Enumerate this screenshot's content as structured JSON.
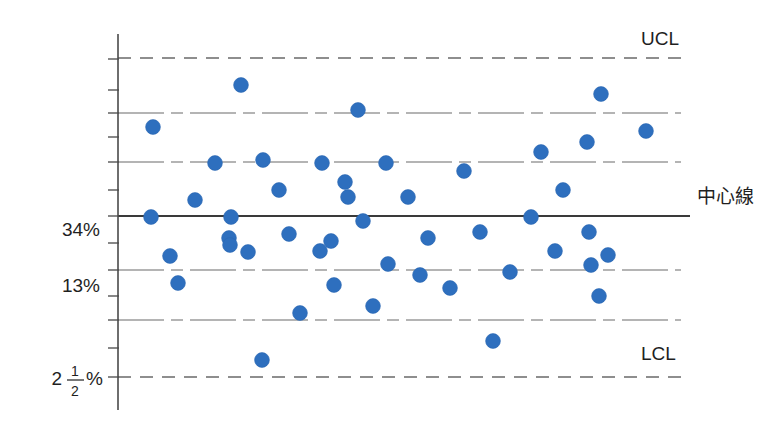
{
  "chart_data": {
    "type": "scatter",
    "title": "",
    "xlabel": "",
    "ylabel": "",
    "grid": true,
    "legend_position": "right",
    "axis": {
      "y_tick_labels": [
        "34%",
        "13%"
      ],
      "y_fraction_label": {
        "whole": "2",
        "numerator": "1",
        "denominator": "2",
        "unit": "%"
      },
      "x_range_visible": false
    },
    "reference_lines": [
      {
        "name": "UCL",
        "label": "UCL",
        "style": "dashed",
        "y_value": 99.85
      },
      {
        "name": "zone_a_upper",
        "label": "",
        "style": "dash-dot",
        "y_value": 97.5
      },
      {
        "name": "zone_b_upper",
        "label": "",
        "style": "dash-dot",
        "y_value": 84
      },
      {
        "name": "center",
        "label": "中心線",
        "style": "solid",
        "y_value": 50
      },
      {
        "name": "zone_b_lower",
        "label": "",
        "style": "dash-dot",
        "y_value": 16
      },
      {
        "name": "zone_a_lower",
        "label": "",
        "style": "dash-dot",
        "y_value": 2.5
      },
      {
        "name": "LCL",
        "label": "LCL",
        "style": "dashed",
        "y_value": 0.15
      }
    ],
    "series": [
      {
        "name": "samples",
        "color": "#2e6fbe",
        "marker": "circle",
        "points": [
          {
            "i": 1,
            "px": 151,
            "py": 217
          },
          {
            "i": 2,
            "px": 153,
            "py": 127
          },
          {
            "i": 3,
            "px": 170,
            "py": 256
          },
          {
            "i": 4,
            "px": 178,
            "py": 283
          },
          {
            "i": 5,
            "px": 195,
            "py": 200
          },
          {
            "i": 6,
            "px": 215,
            "py": 163
          },
          {
            "i": 7,
            "px": 229,
            "py": 238
          },
          {
            "i": 8,
            "px": 241,
            "py": 85
          },
          {
            "i": 9,
            "px": 231,
            "py": 217
          },
          {
            "i": 10,
            "px": 262,
            "py": 360
          },
          {
            "i": 11,
            "px": 230,
            "py": 245
          },
          {
            "i": 12,
            "px": 248,
            "py": 252
          },
          {
            "i": 13,
            "px": 263,
            "py": 160
          },
          {
            "i": 14,
            "px": 279,
            "py": 190
          },
          {
            "i": 15,
            "px": 300,
            "py": 313
          },
          {
            "i": 16,
            "px": 289,
            "py": 234
          },
          {
            "i": 17,
            "px": 322,
            "py": 163
          },
          {
            "i": 18,
            "px": 320,
            "py": 251
          },
          {
            "i": 19,
            "px": 345,
            "py": 182
          },
          {
            "i": 20,
            "px": 331,
            "py": 241
          },
          {
            "i": 21,
            "px": 334,
            "py": 285
          },
          {
            "i": 22,
            "px": 363,
            "py": 221
          },
          {
            "i": 23,
            "px": 348,
            "py": 197
          },
          {
            "i": 24,
            "px": 358,
            "py": 110
          },
          {
            "i": 25,
            "px": 386,
            "py": 163
          },
          {
            "i": 26,
            "px": 373,
            "py": 306
          },
          {
            "i": 27,
            "px": 408,
            "py": 197
          },
          {
            "i": 28,
            "px": 420,
            "py": 275
          },
          {
            "i": 29,
            "px": 388,
            "py": 264
          },
          {
            "i": 30,
            "px": 428,
            "py": 238
          },
          {
            "i": 31,
            "px": 450,
            "py": 288
          },
          {
            "i": 32,
            "px": 464,
            "py": 171
          },
          {
            "i": 33,
            "px": 480,
            "py": 232
          },
          {
            "i": 34,
            "px": 493,
            "py": 341
          },
          {
            "i": 35,
            "px": 510,
            "py": 272
          },
          {
            "i": 36,
            "px": 531,
            "py": 217
          },
          {
            "i": 37,
            "px": 541,
            "py": 152
          },
          {
            "i": 38,
            "px": 555,
            "py": 251
          },
          {
            "i": 39,
            "px": 563,
            "py": 190
          },
          {
            "i": 40,
            "px": 589,
            "py": 232
          },
          {
            "i": 41,
            "px": 587,
            "py": 142
          },
          {
            "i": 42,
            "px": 591,
            "py": 265
          },
          {
            "i": 43,
            "px": 601,
            "py": 94
          },
          {
            "i": 44,
            "px": 599,
            "py": 296
          },
          {
            "i": 45,
            "px": 608,
            "py": 255
          },
          {
            "i": 46,
            "px": 646,
            "py": 131
          }
        ]
      }
    ]
  },
  "geometry": {
    "axis_x": 118,
    "axis_top": 34,
    "axis_bottom": 410,
    "line_x_start": 118,
    "line_x_end": 681,
    "ticks_y": [
      59,
      90,
      113,
      137,
      162,
      190,
      216,
      243,
      270,
      296,
      320,
      348,
      377
    ],
    "limit_lines_y": {
      "ucl": 58,
      "lcl": 377
    },
    "zone_lines_y": [
      113,
      162,
      270,
      320
    ],
    "center_line_y": 216,
    "label_positions": {
      "tick_34_y": 236,
      "tick_13_y": 292,
      "frac_y": 385,
      "ucl_label": {
        "x": 641,
        "y": 45
      },
      "lcl_label": {
        "x": 641,
        "y": 360
      },
      "center_label": {
        "x": 697,
        "y": 203
      }
    }
  },
  "colors": {
    "dot": "#2e6fbe",
    "line": "#6a6a6a",
    "center": "#3a3a3a",
    "axis": "#4a4a4a",
    "text": "#1f1f1f",
    "background": "#ffffff"
  }
}
